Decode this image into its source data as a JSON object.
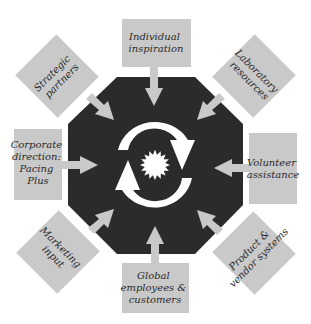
{
  "diagram": {
    "type": "hub-and-spoke",
    "colors": {
      "background": "#ffffff",
      "hub": "#2b2b2b",
      "box": "#c9c9c9",
      "arrow": "#c9c9c9",
      "cycle": "#ffffff",
      "text": "#2a2a2a"
    },
    "hub": {
      "shape": "octagon",
      "center_icons": [
        "cycle-arrows-icon",
        "sunburst-icon"
      ]
    },
    "inputs": [
      {
        "id": "top",
        "lines": [
          "Individual",
          "inspiration"
        ]
      },
      {
        "id": "top_right",
        "lines": [
          "Laboratory",
          "resources"
        ]
      },
      {
        "id": "right",
        "lines": [
          "Volunteer",
          "assistance"
        ]
      },
      {
        "id": "bottom_right",
        "lines": [
          "Product &",
          "vendor systems"
        ]
      },
      {
        "id": "bottom",
        "lines": [
          "Global",
          "employees &",
          "customers"
        ]
      },
      {
        "id": "bottom_left",
        "lines": [
          "Marketing",
          "input"
        ]
      },
      {
        "id": "left",
        "lines": [
          "Corporate",
          "direction:",
          "Pacing",
          "Plus"
        ]
      },
      {
        "id": "top_left",
        "lines": [
          "Strategic",
          "partners"
        ]
      }
    ]
  }
}
